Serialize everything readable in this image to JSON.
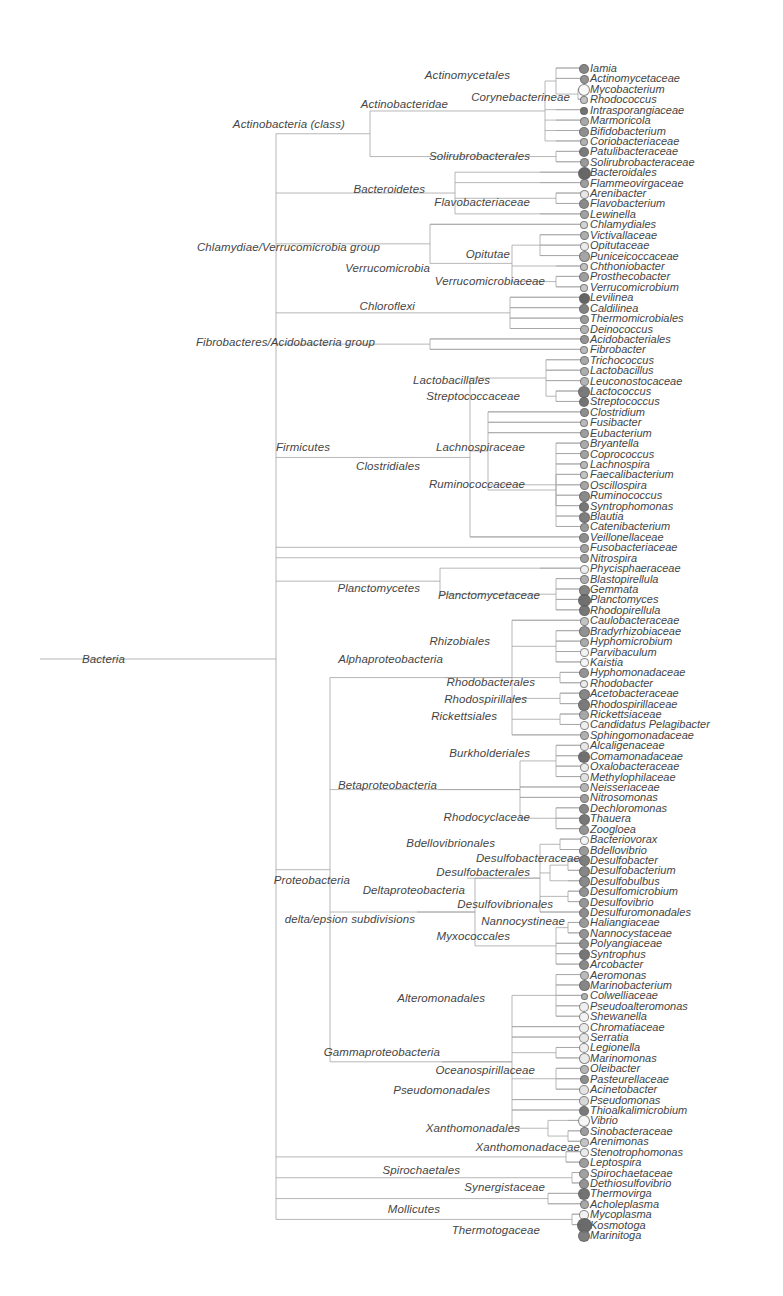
{
  "figure": {
    "kind": "phylogenetic-tree",
    "root_label": "Bacteria",
    "caption": "",
    "colors": {
      "branch": "#9a9a9a",
      "text": "#353535",
      "node_dark": "#4a4a4a",
      "node_light": "#f2f2f2",
      "background": "#ffffff"
    }
  },
  "internal_labels": [
    {
      "text": "Bacteria",
      "x": 125,
      "y": 659
    },
    {
      "text": "Actinobacteria (class)",
      "x": 345,
      "y": 124
    },
    {
      "text": "Actinobacteridae",
      "x": 448,
      "y": 104
    },
    {
      "text": "Actinomycetales",
      "x": 510,
      "y": 75
    },
    {
      "text": "Corynebacterineae",
      "x": 570,
      "y": 97
    },
    {
      "text": "Solirubrobacterales",
      "x": 530,
      "y": 156
    },
    {
      "text": "Bacteroidetes",
      "x": 425,
      "y": 189
    },
    {
      "text": "Flavobacteriaceae",
      "x": 530,
      "y": 202
    },
    {
      "text": "Chlamydiae/Verrucomicrobia group",
      "x": 380,
      "y": 247
    },
    {
      "text": "Opitutae",
      "x": 510,
      "y": 254
    },
    {
      "text": "Verrucomicrobia",
      "x": 430,
      "y": 268
    },
    {
      "text": "Verrucomicrobiaceae",
      "x": 545,
      "y": 281
    },
    {
      "text": "Chloroflexi",
      "x": 415,
      "y": 306
    },
    {
      "text": "Fibrobacteres/Acidobacteria group",
      "x": 375,
      "y": 342
    },
    {
      "text": "Lactobacillales",
      "x": 490,
      "y": 380
    },
    {
      "text": "Streptococcaceae",
      "x": 520,
      "y": 396
    },
    {
      "text": "Firmicutes",
      "x": 330,
      "y": 447
    },
    {
      "text": "Clostridiales",
      "x": 420,
      "y": 466
    },
    {
      "text": "Lachnospiraceae",
      "x": 525,
      "y": 447
    },
    {
      "text": "Ruminococcaceae",
      "x": 525,
      "y": 484
    },
    {
      "text": "Planctomycetes",
      "x": 420,
      "y": 588
    },
    {
      "text": "Planctomycetaceae",
      "x": 540,
      "y": 595
    },
    {
      "text": "Rhizobiales",
      "x": 490,
      "y": 641
    },
    {
      "text": "Alphaproteobacteria",
      "x": 443,
      "y": 659
    },
    {
      "text": "Rhodobacterales",
      "x": 535,
      "y": 682
    },
    {
      "text": "Rhodospirillales",
      "x": 527,
      "y": 699
    },
    {
      "text": "Rickettsiales",
      "x": 497,
      "y": 716
    },
    {
      "text": "Burkholderiales",
      "x": 530,
      "y": 753
    },
    {
      "text": "Betaproteobacteria",
      "x": 437,
      "y": 785
    },
    {
      "text": "Rhodocyclaceae",
      "x": 530,
      "y": 817
    },
    {
      "text": "Bdellovibrionales",
      "x": 495,
      "y": 843
    },
    {
      "text": "Desulfobacteraceae",
      "x": 580,
      "y": 858
    },
    {
      "text": "Desulfobacterales",
      "x": 530,
      "y": 872
    },
    {
      "text": "Proteobacteria",
      "x": 350,
      "y": 880
    },
    {
      "text": "Deltaproteobacteria",
      "x": 465,
      "y": 890
    },
    {
      "text": "Desulfovibrionales",
      "x": 553,
      "y": 904
    },
    {
      "text": "delta/epsion subdivisions",
      "x": 415,
      "y": 919
    },
    {
      "text": "Nannocystineae",
      "x": 565,
      "y": 921
    },
    {
      "text": "Myxococcales",
      "x": 510,
      "y": 936
    },
    {
      "text": "Alteromonadales",
      "x": 485,
      "y": 998
    },
    {
      "text": "Gammaproteobacteria",
      "x": 440,
      "y": 1052
    },
    {
      "text": "Oceanospirillaceae",
      "x": 535,
      "y": 1070
    },
    {
      "text": "Pseudomonadales",
      "x": 490,
      "y": 1090
    },
    {
      "text": "Xanthomonadales",
      "x": 520,
      "y": 1128
    },
    {
      "text": "Xanthomonadaceae",
      "x": 580,
      "y": 1147
    },
    {
      "text": "Spirochaetales",
      "x": 460,
      "y": 1170
    },
    {
      "text": "Synergistaceae",
      "x": 545,
      "y": 1187
    },
    {
      "text": "Mollicutes",
      "x": 440,
      "y": 1209
    },
    {
      "text": "Thermotogaceae",
      "x": 540,
      "y": 1230
    }
  ],
  "tips": [
    {
      "label": "Iamia",
      "size": 8,
      "shade": 0.62
    },
    {
      "label": "Actinomycetaceae",
      "size": 7,
      "shade": 0.55
    },
    {
      "label": "Mycobacterium",
      "size": 10,
      "shade": 0.03
    },
    {
      "label": "Rhodococcus",
      "size": 6,
      "shade": 0.3
    },
    {
      "label": "Intrasporangiaceae",
      "size": 6,
      "shade": 0.72
    },
    {
      "label": "Marmoricola",
      "size": 7,
      "shade": 0.45
    },
    {
      "label": "Bifidobacterium",
      "size": 8,
      "shade": 0.58
    },
    {
      "label": "Coriobacteriaceae",
      "size": 6,
      "shade": 0.4
    },
    {
      "label": "Patulibacteraceae",
      "size": 8,
      "shade": 0.68
    },
    {
      "label": "Solirubrobacteraceae",
      "size": 7,
      "shade": 0.52
    },
    {
      "label": "Bacteroidales",
      "size": 11,
      "shade": 0.78
    },
    {
      "label": "Flammeovirgaceae",
      "size": 7,
      "shade": 0.5
    },
    {
      "label": "Arenibacter",
      "size": 7,
      "shade": 0.12
    },
    {
      "label": "Flavobacterium",
      "size": 8,
      "shade": 0.6
    },
    {
      "label": "Lewinella",
      "size": 7,
      "shade": 0.48
    },
    {
      "label": "Chlamydiales",
      "size": 6,
      "shade": 0.22
    },
    {
      "label": "Victivallaceae",
      "size": 7,
      "shade": 0.42
    },
    {
      "label": "Opitutaceae",
      "size": 7,
      "shade": 0.1
    },
    {
      "label": "Puniceicoccaceae",
      "size": 9,
      "shade": 0.46
    },
    {
      "label": "Chthoniobacter",
      "size": 6,
      "shade": 0.32
    },
    {
      "label": "Prosthecobacter",
      "size": 8,
      "shade": 0.5
    },
    {
      "label": "Verrucomicrobium",
      "size": 6,
      "shade": 0.28
    },
    {
      "label": "Levilinea",
      "size": 9,
      "shade": 0.8
    },
    {
      "label": "Caldilinea",
      "size": 8,
      "shade": 0.65
    },
    {
      "label": "Thermomicrobiales",
      "size": 7,
      "shade": 0.52
    },
    {
      "label": "Deinococcus",
      "size": 7,
      "shade": 0.4
    },
    {
      "label": "Acidobacteriales",
      "size": 7,
      "shade": 0.55
    },
    {
      "label": "Fibrobacter",
      "size": 6,
      "shade": 0.35
    },
    {
      "label": "Trichococcus",
      "size": 7,
      "shade": 0.45
    },
    {
      "label": "Lactobacillus",
      "size": 7,
      "shade": 0.42
    },
    {
      "label": "Leuconostocaceae",
      "size": 7,
      "shade": 0.38
    },
    {
      "label": "Lactococcus",
      "size": 10,
      "shade": 0.68
    },
    {
      "label": "Streptococcus",
      "size": 8,
      "shade": 0.72
    },
    {
      "label": "Clostridium",
      "size": 7,
      "shade": 0.58
    },
    {
      "label": "Fusibacter",
      "size": 6,
      "shade": 0.35
    },
    {
      "label": "Eubacterium",
      "size": 7,
      "shade": 0.5
    },
    {
      "label": "Bryantella",
      "size": 7,
      "shade": 0.44
    },
    {
      "label": "Coprococcus",
      "size": 7,
      "shade": 0.48
    },
    {
      "label": "Lachnospira",
      "size": 6,
      "shade": 0.36
    },
    {
      "label": "Faecalibacterium",
      "size": 6,
      "shade": 0.3
    },
    {
      "label": "Oscillospira",
      "size": 7,
      "shade": 0.46
    },
    {
      "label": "Ruminococcus",
      "size": 9,
      "shade": 0.6
    },
    {
      "label": "Syntrophomonas",
      "size": 8,
      "shade": 0.7
    },
    {
      "label": "Blautia",
      "size": 9,
      "shade": 0.66
    },
    {
      "label": "Catenibacterium",
      "size": 7,
      "shade": 0.52
    },
    {
      "label": "Veillonellaceae",
      "size": 8,
      "shade": 0.58
    },
    {
      "label": "Fusobacteriaceae",
      "size": 7,
      "shade": 0.48
    },
    {
      "label": "Nitrospira",
      "size": 7,
      "shade": 0.5
    },
    {
      "label": "Phycisphaeraceae",
      "size": 7,
      "shade": 0.08
    },
    {
      "label": "Blastopirellula",
      "size": 7,
      "shade": 0.42
    },
    {
      "label": "Gemmata",
      "size": 9,
      "shade": 0.64
    },
    {
      "label": "Planctomyces",
      "size": 11,
      "shade": 0.74
    },
    {
      "label": "Rhodopirellula",
      "size": 9,
      "shade": 0.7
    },
    {
      "label": "Caulobacteraceae",
      "size": 7,
      "shade": 0.3
    },
    {
      "label": "Bradyrhizobiaceae",
      "size": 9,
      "shade": 0.56
    },
    {
      "label": "Hyphomicrobium",
      "size": 7,
      "shade": 0.44
    },
    {
      "label": "Parvibaculum",
      "size": 7,
      "shade": 0.06
    },
    {
      "label": "Kaistia",
      "size": 7,
      "shade": 0.05
    },
    {
      "label": "Hyphomonadaceae",
      "size": 8,
      "shade": 0.55
    },
    {
      "label": "Rhodobacter",
      "size": 6,
      "shade": 0.1
    },
    {
      "label": "Acetobacteraceae",
      "size": 9,
      "shade": 0.62
    },
    {
      "label": "Rhodospirillaceae",
      "size": 10,
      "shade": 0.68
    },
    {
      "label": "Rickettsiaceae",
      "size": 8,
      "shade": 0.45
    },
    {
      "label": "Candidatus Pelagibacter",
      "size": 7,
      "shade": 0.08
    },
    {
      "label": "Sphingomonadaceae",
      "size": 7,
      "shade": 0.4
    },
    {
      "label": "Alcaligenaceae",
      "size": 7,
      "shade": 0.12
    },
    {
      "label": "Comamonadaceae",
      "size": 10,
      "shade": 0.74
    },
    {
      "label": "Oxalobacteraceae",
      "size": 7,
      "shade": 0.1
    },
    {
      "label": "Methylophilaceae",
      "size": 7,
      "shade": 0.15
    },
    {
      "label": "Neisseriaceae",
      "size": 7,
      "shade": 0.38
    },
    {
      "label": "Nitrosomonas",
      "size": 7,
      "shade": 0.5
    },
    {
      "label": "Dechloromonas",
      "size": 8,
      "shade": 0.62
    },
    {
      "label": "Thauera",
      "size": 9,
      "shade": 0.7
    },
    {
      "label": "Zoogloea",
      "size": 8,
      "shade": 0.55
    },
    {
      "label": "Bacteriovorax",
      "size": 7,
      "shade": 0.05
    },
    {
      "label": "Bdellovibrio",
      "size": 8,
      "shade": 0.52
    },
    {
      "label": "Desulfobacter",
      "size": 9,
      "shade": 0.66
    },
    {
      "label": "Desulfobacterium",
      "size": 9,
      "shade": 0.62
    },
    {
      "label": "Desulfobulbus",
      "size": 9,
      "shade": 0.6
    },
    {
      "label": "Desulfomicrobium",
      "size": 8,
      "shade": 0.56
    },
    {
      "label": "Desulfovibrio",
      "size": 8,
      "shade": 0.54
    },
    {
      "label": "Desulfuromonadales",
      "size": 8,
      "shade": 0.58
    },
    {
      "label": "Haliangiaceae",
      "size": 8,
      "shade": 0.52
    },
    {
      "label": "Nannocystaceae",
      "size": 8,
      "shade": 0.55
    },
    {
      "label": "Polyangiaceae",
      "size": 8,
      "shade": 0.58
    },
    {
      "label": "Syntrophus",
      "size": 9,
      "shade": 0.7
    },
    {
      "label": "Arcobacter",
      "size": 8,
      "shade": 0.6
    },
    {
      "label": "Aeromonas",
      "size": 7,
      "shade": 0.35
    },
    {
      "label": "Marinobacterium",
      "size": 9,
      "shade": 0.62
    },
    {
      "label": "Colwelliaceae",
      "size": 5,
      "shade": 0.4
    },
    {
      "label": "Pseudoalteromonas",
      "size": 8,
      "shade": 0.08
    },
    {
      "label": "Shewanella",
      "size": 8,
      "shade": 0.06
    },
    {
      "label": "Chromatiaceae",
      "size": 8,
      "shade": 0.1
    },
    {
      "label": "Serratia",
      "size": 8,
      "shade": 0.12
    },
    {
      "label": "Legionella",
      "size": 8,
      "shade": 0.08
    },
    {
      "label": "Marinomonas",
      "size": 9,
      "shade": 0.1
    },
    {
      "label": "Oleibacter",
      "size": 7,
      "shade": 0.38
    },
    {
      "label": "Pasteurellaceae",
      "size": 7,
      "shade": 0.58
    },
    {
      "label": "Acinetobacter",
      "size": 8,
      "shade": 0.14
    },
    {
      "label": "Pseudomonas",
      "size": 8,
      "shade": 0.2
    },
    {
      "label": "Thioalkalimicrobium",
      "size": 8,
      "shade": 0.68
    },
    {
      "label": "Vibrio",
      "size": 10,
      "shade": 0.04
    },
    {
      "label": "Sinobacteraceae",
      "size": 7,
      "shade": 0.5
    },
    {
      "label": "Arenimonas",
      "size": 7,
      "shade": 0.3
    },
    {
      "label": "Stenotrophomonas",
      "size": 7,
      "shade": 0.1
    },
    {
      "label": "Leptospira",
      "size": 8,
      "shade": 0.5
    },
    {
      "label": "Spirochaetaceae",
      "size": 8,
      "shade": 0.48
    },
    {
      "label": "Dethiosulfovibrio",
      "size": 8,
      "shade": 0.55
    },
    {
      "label": "Thermovirga",
      "size": 10,
      "shade": 0.72
    },
    {
      "label": "Acholeplasma",
      "size": 7,
      "shade": 0.45
    },
    {
      "label": "Mycoplasma",
      "size": 8,
      "shade": 0.06
    },
    {
      "label": "Kosmotoga",
      "size": 13,
      "shade": 0.76
    },
    {
      "label": "Marinitoga",
      "size": 10,
      "shade": 0.66
    }
  ]
}
